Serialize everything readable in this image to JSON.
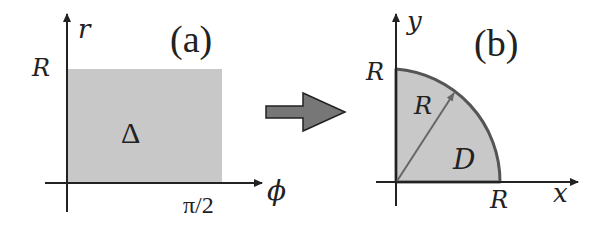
{
  "panel_a": {
    "title": "(a)",
    "y_axis_label": "r",
    "x_axis_label": "ϕ",
    "y_tick": "R",
    "x_tick": "π/2",
    "region_label": "Δ",
    "fill_color": "#c8c8c8"
  },
  "arrow": {
    "color": "#777777"
  },
  "panel_b": {
    "title": "(b)",
    "y_axis_label": "y",
    "x_axis_label": "x",
    "y_tick": "R",
    "x_tick": "R",
    "radius_label": "R",
    "region_label": "D",
    "fill_color": "#c8c8c8",
    "edge_color": "#555555"
  }
}
